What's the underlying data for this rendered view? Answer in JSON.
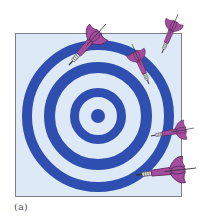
{
  "figure": {
    "caption": "(a)",
    "colors": {
      "background": "#ffffff",
      "panel_fill": "#dde9f7",
      "panel_border": "#7a7f88",
      "ring": "#2f4fb0",
      "dart_flight": "#a34d9f",
      "dart_outline": "#5c2759",
      "dart_barrel": "#9a9a9a",
      "dart_tip": "#333333",
      "caption": "#555555"
    },
    "panel": {
      "x": 15,
      "y": 33,
      "width": 166,
      "height": 163
    },
    "target": {
      "cx": 98,
      "cy": 116,
      "bullseye_radius": 7,
      "rings": [
        {
          "inner_radius": 19,
          "outer_radius": 28
        },
        {
          "inner_radius": 43,
          "outer_radius": 54
        },
        {
          "inner_radius": 66,
          "outer_radius": 76
        }
      ]
    },
    "darts": [
      {
        "id": "dart-1",
        "tip": [
          69,
          65
        ],
        "tail": [
          106,
          24
        ]
      },
      {
        "id": "dart-2",
        "tip": [
          149,
          84
        ],
        "tail": [
          132,
          44
        ]
      },
      {
        "id": "dart-3",
        "tip": [
          162,
          53
        ],
        "tail": [
          178,
          14
        ]
      },
      {
        "id": "dart-4",
        "tip": [
          151,
          136
        ],
        "tail": [
          194,
          128
        ]
      },
      {
        "id": "dart-5",
        "tip": [
          136,
          175
        ],
        "tail": [
          196,
          168
        ]
      }
    ]
  }
}
